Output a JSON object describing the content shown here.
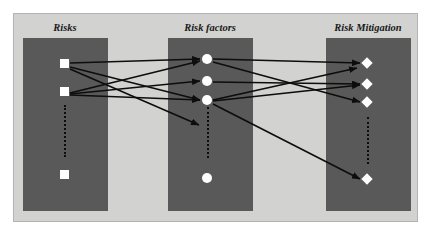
{
  "diagram": {
    "type": "tripartite-flow",
    "background_color": "#ffffff",
    "frame": {
      "fill": "#d2d2d0",
      "border": "#b4b4b2",
      "x": 13,
      "y": 13,
      "w": 405,
      "h": 209
    },
    "panel_fill": "#595959",
    "node_fill": "#ffffff",
    "edge_color": "#0d0d0d",
    "ellipsis_color": "#0d0d0d"
  },
  "columns": [
    {
      "id": "risks",
      "label": "Risks",
      "label_x": 64,
      "label_y": 21,
      "panel": {
        "x": 22,
        "y": 37,
        "w": 85,
        "h": 173
      },
      "node_shape": "square",
      "nodes": [
        {
          "id": "r1",
          "cx": 63,
          "cy": 62
        },
        {
          "id": "r2",
          "cx": 63,
          "cy": 90
        },
        {
          "id": "r3",
          "cx": 63,
          "cy": 173
        }
      ],
      "ellipsis": {
        "x": 63,
        "y1": 104,
        "y2": 156
      }
    },
    {
      "id": "risk-factors",
      "label": "Risk factors",
      "label_x": 209,
      "label_y": 21,
      "panel": {
        "x": 167,
        "y": 37,
        "w": 85,
        "h": 173
      },
      "node_shape": "circle",
      "nodes": [
        {
          "id": "f1",
          "cx": 206,
          "cy": 58
        },
        {
          "id": "f2",
          "cx": 206,
          "cy": 80
        },
        {
          "id": "f3",
          "cx": 206,
          "cy": 99
        },
        {
          "id": "f4",
          "cx": 206,
          "cy": 177
        }
      ],
      "ellipsis": {
        "x": 206,
        "y1": 106,
        "y2": 157
      }
    },
    {
      "id": "risk-mitigation",
      "label": "Risk Mitigation",
      "label_x": 367,
      "label_y": 21,
      "panel": {
        "x": 325,
        "y": 37,
        "w": 85,
        "h": 173
      },
      "node_shape": "diamond",
      "nodes": [
        {
          "id": "m1",
          "cx": 366,
          "cy": 62
        },
        {
          "id": "m2",
          "cx": 366,
          "cy": 83
        },
        {
          "id": "m3",
          "cx": 366,
          "cy": 101
        },
        {
          "id": "m4",
          "cx": 366,
          "cy": 178
        }
      ],
      "ellipsis": {
        "x": 366,
        "y1": 116,
        "y2": 163
      }
    }
  ],
  "edges": [
    {
      "id": "e1",
      "from": "r1",
      "to": "f1",
      "x1": 69,
      "y1": 62,
      "x2": 199,
      "y2": 58
    },
    {
      "id": "e2",
      "from": "r1",
      "to": "f3",
      "x1": 69,
      "y1": 66,
      "x2": 199,
      "y2": 99
    },
    {
      "id": "e3",
      "from": "r1",
      "to": "ellipsis",
      "x1": 69,
      "y1": 68,
      "x2": 198,
      "y2": 124
    },
    {
      "id": "e4",
      "from": "r2",
      "to": "f1",
      "x1": 69,
      "y1": 92,
      "x2": 199,
      "y2": 60
    },
    {
      "id": "e5",
      "from": "r2",
      "to": "f2",
      "x1": 69,
      "y1": 93,
      "x2": 199,
      "y2": 80
    },
    {
      "id": "e6",
      "from": "r2",
      "to": "f3",
      "x1": 69,
      "y1": 94,
      "x2": 199,
      "y2": 99
    },
    {
      "id": "e7",
      "from": "f1",
      "to": "m1",
      "x1": 212,
      "y1": 58,
      "x2": 359,
      "y2": 62
    },
    {
      "id": "e8",
      "from": "f1",
      "to": "m3",
      "x1": 212,
      "y1": 61,
      "x2": 359,
      "y2": 101
    },
    {
      "id": "e9",
      "from": "f2",
      "to": "m2",
      "x1": 212,
      "y1": 81,
      "x2": 359,
      "y2": 83
    },
    {
      "id": "e10",
      "from": "f3",
      "to": "m1",
      "x1": 212,
      "y1": 99,
      "x2": 356,
      "y2": 67
    },
    {
      "id": "e11",
      "from": "f3",
      "to": "m2",
      "x1": 212,
      "y1": 100,
      "x2": 359,
      "y2": 84
    },
    {
      "id": "e12",
      "from": "f3",
      "to": "m4",
      "x1": 212,
      "y1": 103,
      "x2": 359,
      "y2": 178
    }
  ]
}
